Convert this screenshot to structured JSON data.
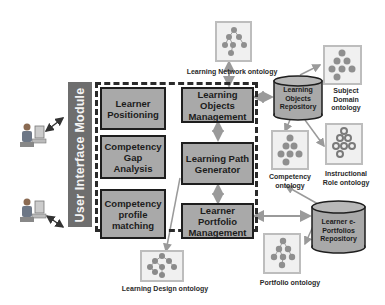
{
  "diagram": {
    "user_interface_module": "User Interface Module",
    "modules": {
      "learner_positioning": "Learner Positioning",
      "competency_gap_analysis": "Competency Gap Analysis",
      "competency_profile_matching": "Competency profile matching",
      "learning_objects_management": "Learning Objects Management",
      "learning_path_generator": "Learning Path Generator",
      "learner_portfolio_management": "Learner Portfolio Management"
    },
    "repositories": {
      "learning_objects": "Learning Objects Repository",
      "learner_eportfolios": "Learner e-Portfolios Repository"
    },
    "ontologies": {
      "learning_network": "Learning Network ontology",
      "subject_domain": "Subject Domain ontology",
      "competency": "Competency ontology",
      "instructional_role": "Instructional Role ontology",
      "portfolio": "Portfolio ontology",
      "learning_design": "Learning Design ontology"
    },
    "actors": [
      "user",
      "user"
    ],
    "colors": {
      "module_fill": "#a9a9a9",
      "ui_bar": "#6e6e6e",
      "arrow": "#9a9a9a",
      "node": "#8a8a8a"
    }
  }
}
